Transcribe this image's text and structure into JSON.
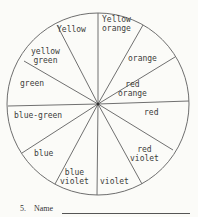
{
  "wheel": {
    "center": [
      98,
      104
    ],
    "radius": 91,
    "stroke_color": "#6e6e6e",
    "segments": [
      {
        "label": "Yellow",
        "lines": [
          "Yellow"
        ]
      },
      {
        "label": "Yellow orange",
        "lines": [
          "Yellow",
          "orange"
        ]
      },
      {
        "label": "orange",
        "lines": [
          "orange"
        ]
      },
      {
        "label": "red orange",
        "lines": [
          "red",
          "orange"
        ]
      },
      {
        "label": "red",
        "lines": [
          "red"
        ]
      },
      {
        "label": "red violet",
        "lines": [
          "red",
          "violet"
        ]
      },
      {
        "label": "violet",
        "lines": [
          "violet"
        ]
      },
      {
        "label": "blue violet",
        "lines": [
          "blue",
          "violet"
        ]
      },
      {
        "label": "blue",
        "lines": [
          "blue"
        ]
      },
      {
        "label": "blue-green",
        "lines": [
          "blue-green"
        ]
      },
      {
        "label": "green",
        "lines": [
          "green"
        ]
      },
      {
        "label": "yellow green",
        "lines": [
          "yellow",
          "green"
        ]
      }
    ]
  },
  "footer": {
    "number": "5.",
    "name_label": "Name"
  }
}
